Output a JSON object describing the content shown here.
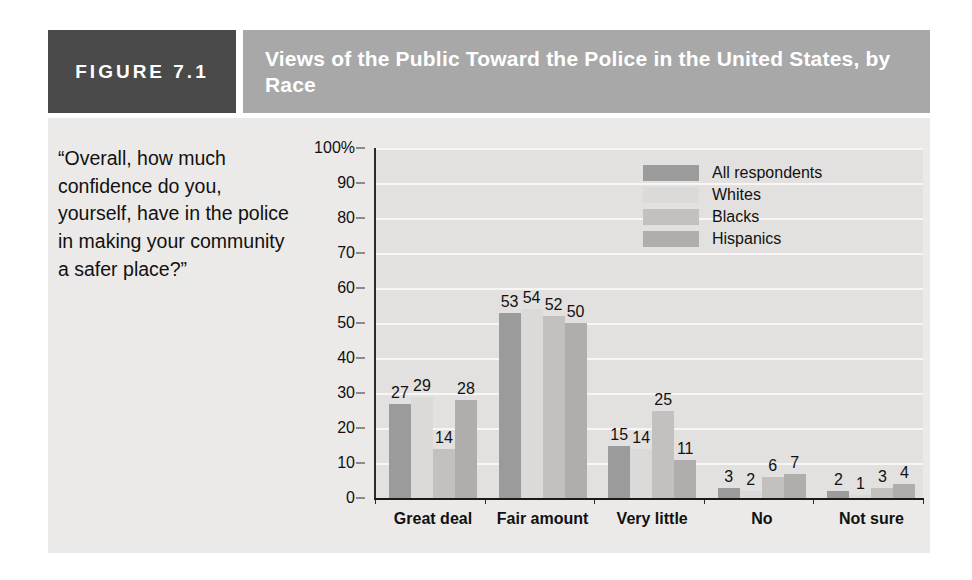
{
  "figure": {
    "tag": "FIGURE 7.1",
    "title": "Views of the Public Toward the Police in the United States, by Race",
    "question": "“Overall, how much confidence do you, yourself, have in the police in making your community a safer place?”"
  },
  "colors": {
    "tag_box_bg": "#4a4a4a",
    "title_box_bg": "#a8a8a8",
    "panel_bg": "#eceae8",
    "plot_bg": "#e3e1df",
    "gridline": "#f7f6f5",
    "axis": "#1a1a1a",
    "text": "#111111",
    "series_all_respondents": "#9b9b9b",
    "series_whites": "#dcdad8",
    "series_blacks": "#c3c1bf",
    "series_hispanics": "#b0aeac"
  },
  "chart_data": {
    "type": "bar",
    "title": "Views of the Public Toward the Police in the United States, by Race",
    "xlabel": "",
    "ylabel": "",
    "ylim": [
      0,
      100
    ],
    "yticks": [
      0,
      10,
      20,
      30,
      40,
      50,
      60,
      70,
      80,
      90,
      100
    ],
    "ytick_labels": [
      "0",
      "10",
      "20",
      "30",
      "40",
      "50",
      "60",
      "70",
      "80",
      "90",
      "100%"
    ],
    "grid": true,
    "legend_position": "upper-center-right",
    "categories": [
      "Great deal",
      "Fair amount",
      "Very little",
      "No",
      "Not sure"
    ],
    "series": [
      {
        "name": "All respondents",
        "color": "#9b9b9b",
        "values": [
          27,
          53,
          15,
          3,
          2
        ]
      },
      {
        "name": "Whites",
        "color": "#dcdad8",
        "values": [
          29,
          54,
          14,
          2,
          1
        ]
      },
      {
        "name": "Blacks",
        "color": "#c3c1bf",
        "values": [
          14,
          52,
          25,
          6,
          3
        ]
      },
      {
        "name": "Hispanics",
        "color": "#b0aeac",
        "values": [
          28,
          50,
          11,
          7,
          4
        ]
      }
    ]
  }
}
